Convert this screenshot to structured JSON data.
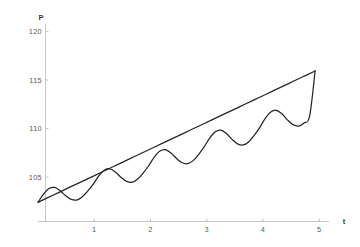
{
  "chart_data": {
    "type": "line",
    "title": "",
    "xlabel": "t",
    "ylabel": "P",
    "xlim": [
      0,
      5.25
    ],
    "ylim": [
      100.6,
      121.2
    ],
    "grid": false,
    "legend": "none",
    "xticks": [
      1,
      2,
      3,
      4,
      5
    ],
    "xtick_labels": [
      "1",
      "2",
      "3",
      "4",
      "5"
    ],
    "yticks": [
      105,
      110,
      115,
      120
    ],
    "ytick_labels": [
      "105",
      "110",
      "115",
      "120"
    ],
    "series": [
      {
        "name": "trend",
        "description": "straight rising line",
        "x": [
          0,
          0.25,
          0.5,
          0.75,
          1,
          1.25,
          1.5,
          1.75,
          2,
          2.25,
          2.5,
          2.75,
          3,
          3.25,
          3.5,
          3.75,
          4,
          4.25,
          4.5,
          4.75,
          5
        ],
        "values": [
          102.6,
          103.29,
          103.97,
          104.66,
          105.34,
          106.03,
          106.71,
          107.4,
          108.08,
          108.77,
          109.45,
          110.14,
          110.82,
          111.51,
          112.19,
          112.88,
          113.56,
          114.25,
          114.93,
          115.62,
          116.3
        ]
      },
      {
        "name": "oscillation",
        "description": "sine of period 1 with slowly growing amplitude riding on the trend",
        "x": [
          0,
          0.1,
          0.2,
          0.3,
          0.4,
          0.5,
          0.6,
          0.7,
          0.8,
          0.9,
          1,
          1.1,
          1.2,
          1.3,
          1.4,
          1.5,
          1.6,
          1.7,
          1.8,
          1.9,
          2,
          2.1,
          2.2,
          2.3,
          2.4,
          2.5,
          2.6,
          2.7,
          2.8,
          2.9,
          3,
          3.1,
          3.2,
          3.3,
          3.4,
          3.5,
          3.6,
          3.7,
          3.8,
          3.9,
          4,
          4.1,
          4.2,
          4.3,
          4.4,
          4.5,
          4.6,
          4.7,
          4.8,
          4.9,
          5
        ],
        "values": [
          102.6,
          103.46,
          104.04,
          104.15,
          103.81,
          103.29,
          102.9,
          102.84,
          103.18,
          103.8,
          104.52,
          105.39,
          105.97,
          106.09,
          105.74,
          105.2,
          104.79,
          104.71,
          105.04,
          105.68,
          106.44,
          107.34,
          107.95,
          108.09,
          107.74,
          107.17,
          106.73,
          106.63,
          106.95,
          107.61,
          108.4,
          109.33,
          109.97,
          110.13,
          109.77,
          109.17,
          108.7,
          108.58,
          108.9,
          109.58,
          110.4,
          111.36,
          112.03,
          112.2,
          111.84,
          111.2,
          110.7,
          110.56,
          110.88,
          111.58,
          116.3
        ]
      }
    ]
  },
  "axes": {
    "y_axis_label": "P",
    "x_axis_label": "t"
  }
}
